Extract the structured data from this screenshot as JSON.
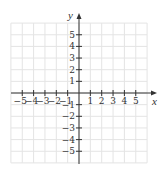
{
  "figure": {
    "type": "coordinate-plane",
    "x_axis_label": "x",
    "y_axis_label": "y",
    "x_range": [
      -6,
      6
    ],
    "y_range": [
      -6,
      6
    ],
    "x_tick_labels": [
      "−5",
      "−4",
      "−3",
      "−2",
      "−1",
      "1",
      "2",
      "3",
      "4",
      "5"
    ],
    "x_tick_values": [
      -5,
      -4,
      -3,
      -2,
      -1,
      1,
      2,
      3,
      4,
      5
    ],
    "y_tick_labels": [
      "5",
      "4",
      "3",
      "2",
      "1",
      "−1",
      "−2",
      "−3",
      "−4",
      "−5"
    ],
    "y_tick_values": [
      5,
      4,
      3,
      2,
      1,
      -1,
      -2,
      -3,
      -4,
      -5
    ],
    "grid": true,
    "colors": {
      "grid": "#e4e4e4",
      "axis": "#333333",
      "text": "#333333",
      "background": "#ffffff"
    }
  },
  "layout": {
    "origin_x": 79,
    "origin_y": 93,
    "unit_x": 11.35,
    "unit_y": 11.65,
    "grid_cells": 6,
    "x_axis_end": 157,
    "y_axis_top": 13,
    "y_axis_bottom": 164,
    "x_axis_start": 11
  }
}
